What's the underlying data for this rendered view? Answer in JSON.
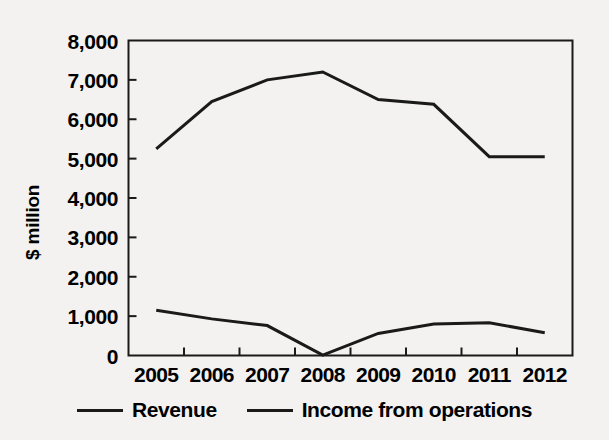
{
  "chart_data": {
    "type": "line",
    "title": "",
    "xlabel": "",
    "ylabel": "$ million",
    "categories": [
      "2005",
      "2006",
      "2007",
      "2008",
      "2009",
      "2010",
      "2011",
      "2012"
    ],
    "ylim": [
      0,
      8000
    ],
    "ytick_labels": [
      "8,000",
      "7,000",
      "6,000",
      "5,000",
      "4,000",
      "3,000",
      "2,000",
      "1,000",
      "0"
    ],
    "ytick_values": [
      8000,
      7000,
      6000,
      5000,
      4000,
      3000,
      2000,
      1000,
      0
    ],
    "grid": false,
    "legend_position": "bottom",
    "series": [
      {
        "name": "Revenue",
        "color": "#1a1a1a",
        "values": [
          5250,
          6450,
          7000,
          7200,
          6500,
          6380,
          5050,
          5050
        ]
      },
      {
        "name": "Income from operations",
        "color": "#1a1a1a",
        "values": [
          1150,
          930,
          760,
          10,
          560,
          800,
          830,
          580
        ]
      }
    ]
  },
  "axes": {
    "y_title": "$ million"
  },
  "legend": {
    "items": [
      {
        "label": "Revenue"
      },
      {
        "label": "Income from operations"
      }
    ]
  }
}
